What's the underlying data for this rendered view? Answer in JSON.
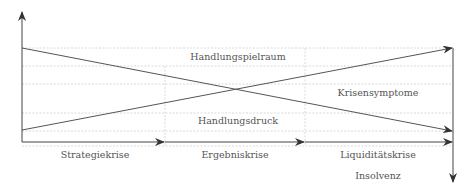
{
  "diagram": {
    "regions": [
      {
        "id": "handlungsspielraum",
        "label": "Handlungspielraum"
      },
      {
        "id": "krisensymptome",
        "label": "Krisensymptome"
      },
      {
        "id": "handlungsdruck",
        "label": "Handlungsdruck"
      }
    ],
    "phases": [
      {
        "label": "Strategiekrise"
      },
      {
        "label": "Ergebniskrise"
      },
      {
        "label": "Liquiditätskrise"
      }
    ],
    "end_state": {
      "label": "Insolvenz"
    },
    "colors": {
      "line": "#555555",
      "grid": "#cccccc",
      "text": "#555555"
    }
  }
}
